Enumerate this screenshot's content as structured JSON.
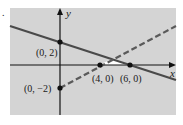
{
  "figure": {
    "type": "system-of-linear-inequalities-graph",
    "marker": ".",
    "axes": {
      "x_label": "x",
      "y_label": "y"
    },
    "colors": {
      "background": "#d4d4d4",
      "solution_region": "#ffffff",
      "lines": "#4a4a4a",
      "axes": "#111111"
    },
    "lines": [
      {
        "name": "boundary-solid",
        "style": "solid",
        "through": [
          "(0, 2)",
          "(6, 0)"
        ]
      },
      {
        "name": "boundary-dashed",
        "style": "dashed",
        "through": [
          "(0, -2)",
          "(4, 0)"
        ]
      }
    ],
    "points": [
      {
        "label": "(0, 2)"
      },
      {
        "label": "(0, −2)"
      },
      {
        "label": "(4, 0)"
      },
      {
        "label": "(6, 0)"
      }
    ],
    "solution_region": "bounded triangle between (4, 0), (6, 0) and the intersection of the lines"
  }
}
